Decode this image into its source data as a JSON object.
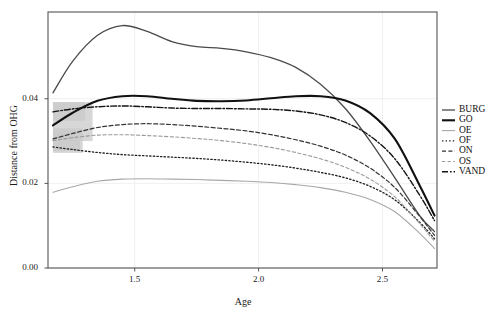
{
  "chart_data": {
    "type": "line",
    "title": "",
    "xlabel": "Age",
    "ylabel": "Distance from OHG",
    "xlim": [
      1.15,
      2.72
    ],
    "ylim": [
      0.0,
      0.0605
    ],
    "xticks": [
      1.5,
      2.0,
      2.5
    ],
    "xticklabels": [
      "1.5",
      "2.0",
      "2.5"
    ],
    "yticks": [
      0.0,
      0.02,
      0.04
    ],
    "yticklabels": [
      "0.00",
      "0.02",
      "0.04"
    ],
    "grid": true,
    "grid_color": "#f0f0f0",
    "legend_position": "right",
    "panel_border_color": "#555555",
    "background": "#ffffff",
    "confidence_band_color": "#c9c9c9",
    "x": [
      1.17,
      1.25,
      1.35,
      1.45,
      1.55,
      1.65,
      1.75,
      1.85,
      1.95,
      2.05,
      2.15,
      2.25,
      2.35,
      2.45,
      2.55,
      2.65,
      2.71
    ],
    "series": [
      {
        "name": "BURG",
        "style": "solid",
        "color": "#4a4a4a",
        "width": 1.3,
        "values": [
          0.0414,
          0.0489,
          0.055,
          0.0573,
          0.0559,
          0.0535,
          0.0523,
          0.0519,
          0.0511,
          0.0497,
          0.0474,
          0.0434,
          0.0377,
          0.03,
          0.0213,
          0.0124,
          0.0086
        ]
      },
      {
        "name": "GO",
        "style": "solid",
        "color": "#111111",
        "width": 2.1,
        "values": [
          0.0337,
          0.0367,
          0.0395,
          0.0406,
          0.0406,
          0.04,
          0.0395,
          0.0394,
          0.0396,
          0.0401,
          0.0406,
          0.0406,
          0.0396,
          0.0366,
          0.0305,
          0.0195,
          0.0124
        ]
      },
      {
        "name": "OE",
        "style": "solid",
        "color": "#a8a8a8",
        "width": 1.1,
        "values": [
          0.0179,
          0.0192,
          0.0205,
          0.021,
          0.0211,
          0.021,
          0.0209,
          0.0207,
          0.0205,
          0.0202,
          0.0197,
          0.019,
          0.0179,
          0.0162,
          0.0133,
          0.0082,
          0.0046
        ]
      },
      {
        "name": "OF",
        "style": "dotted",
        "color": "#1f1f1f",
        "width": 1.3,
        "values": [
          0.0286,
          0.028,
          0.0273,
          0.0268,
          0.0265,
          0.0262,
          0.0259,
          0.0255,
          0.025,
          0.0244,
          0.0236,
          0.0226,
          0.0213,
          0.0193,
          0.0161,
          0.0108,
          0.0069
        ]
      },
      {
        "name": "ON",
        "style": "dashed",
        "color": "#333333",
        "width": 1.2,
        "values": [
          0.0305,
          0.0318,
          0.0332,
          0.0339,
          0.0341,
          0.0339,
          0.0335,
          0.033,
          0.0324,
          0.0315,
          0.0303,
          0.0288,
          0.0267,
          0.0236,
          0.019,
          0.0122,
          0.0077
        ]
      },
      {
        "name": "OS",
        "style": "dashed-light",
        "color": "#9a9a9a",
        "width": 1.1,
        "values": [
          0.0301,
          0.0308,
          0.0314,
          0.0315,
          0.0313,
          0.031,
          0.0306,
          0.0301,
          0.0294,
          0.0285,
          0.0273,
          0.0258,
          0.0238,
          0.021,
          0.0168,
          0.0105,
          0.0063
        ]
      },
      {
        "name": "VAND",
        "style": "dash-dot",
        "color": "#141414",
        "width": 1.4,
        "values": [
          0.0369,
          0.0376,
          0.0381,
          0.0383,
          0.0381,
          0.0378,
          0.0377,
          0.0377,
          0.0376,
          0.0375,
          0.0371,
          0.0362,
          0.0344,
          0.0312,
          0.0258,
          0.0172,
          0.0112
        ]
      }
    ],
    "confidence_bands": [
      {
        "name": "GO",
        "x0": 1.17,
        "x1": 1.33,
        "y_low": 0.03,
        "y_high": 0.0392
      },
      {
        "name": "VAND",
        "x0": 1.17,
        "x1": 1.3,
        "y_low": 0.0348,
        "y_high": 0.0392
      },
      {
        "name": "ON",
        "x0": 1.17,
        "x1": 1.29,
        "y_low": 0.0272,
        "y_high": 0.033
      },
      {
        "name": "OS",
        "x0": 1.17,
        "x1": 1.28,
        "y_low": 0.0276,
        "y_high": 0.0325
      }
    ]
  },
  "legend": {
    "items": [
      {
        "label": "BURG"
      },
      {
        "label": "GO"
      },
      {
        "label": "OE"
      },
      {
        "label": "OF"
      },
      {
        "label": "ON"
      },
      {
        "label": "OS"
      },
      {
        "label": "VAND"
      }
    ]
  }
}
